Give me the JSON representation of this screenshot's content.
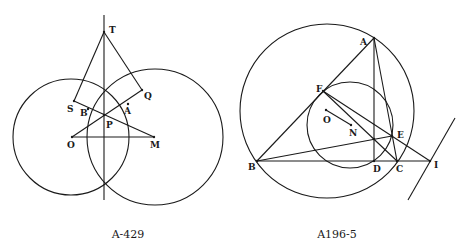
{
  "figures": [
    {
      "id": "left",
      "caption": "A-429",
      "caption_pos": [
        128,
        238
      ],
      "circles": [
        {
          "name": "circle-o",
          "cx": 71,
          "cy": 137,
          "r": 58
        },
        {
          "name": "circle-m",
          "cx": 155,
          "cy": 137,
          "r": 68
        }
      ],
      "points": {
        "T": [
          104,
          32
        ],
        "S": [
          74,
          101
        ],
        "Q": [
          142,
          90
        ],
        "B": [
          88,
          109
        ],
        "A": [
          128,
          104
        ],
        "P": [
          104,
          115
        ],
        "O": [
          72,
          137
        ],
        "M": [
          154,
          137
        ]
      },
      "labels": [
        {
          "text": "T",
          "x": 109,
          "y": 33
        },
        {
          "text": "S",
          "x": 67,
          "y": 112
        },
        {
          "text": "B",
          "x": 80,
          "y": 116
        },
        {
          "text": "A",
          "x": 124,
          "y": 114
        },
        {
          "text": "Q",
          "x": 144,
          "y": 99
        },
        {
          "text": "P",
          "x": 106,
          "y": 128
        },
        {
          "text": "O",
          "x": 67,
          "y": 148
        },
        {
          "text": "M",
          "x": 150,
          "y": 148
        }
      ],
      "segments": [
        {
          "name": "vertical-axis",
          "from": [
            104,
            15
          ],
          "to": [
            104,
            200
          ]
        },
        {
          "name": "segment-ts",
          "from": "T",
          "to": "S"
        },
        {
          "name": "segment-tq",
          "from": "T",
          "to": "Q"
        },
        {
          "name": "segment-sm",
          "from": "S",
          "to": "M"
        },
        {
          "name": "segment-oq",
          "from": "O",
          "to": "Q"
        },
        {
          "name": "segment-om",
          "from": "O",
          "to": "M"
        }
      ]
    },
    {
      "id": "right",
      "caption": "A196-5",
      "caption_pos": [
        337,
        238
      ],
      "circles": [
        {
          "name": "circumcircle",
          "cx": 327,
          "cy": 111,
          "r": 87
        },
        {
          "name": "nine-point-circle",
          "cx": 350,
          "cy": 125,
          "r": 43
        }
      ],
      "points": {
        "A": [
          374,
          38
        ],
        "B": [
          257,
          161
        ],
        "C": [
          397,
          161
        ],
        "D": [
          374,
          161
        ],
        "E": [
          392,
          136
        ],
        "F": [
          323,
          91
        ],
        "I": [
          430,
          161
        ],
        "O": [
          326,
          110
        ],
        "N": [
          351,
          125
        ],
        "H": [
          374,
          139
        ]
      },
      "labels": [
        {
          "text": "A",
          "x": 360,
          "y": 45
        },
        {
          "text": "F",
          "x": 316,
          "y": 92
        },
        {
          "text": "O",
          "x": 323,
          "y": 123
        },
        {
          "text": "N",
          "x": 349,
          "y": 136
        },
        {
          "text": "E",
          "x": 397,
          "y": 138
        },
        {
          "text": "B",
          "x": 248,
          "y": 170
        },
        {
          "text": "D",
          "x": 373,
          "y": 172
        },
        {
          "text": "C",
          "x": 396,
          "y": 172
        },
        {
          "text": "I",
          "x": 434,
          "y": 168
        }
      ],
      "segments": [
        {
          "name": "side-ab",
          "from": "A",
          "to": "B"
        },
        {
          "name": "side-ac",
          "from": "A",
          "to": "C"
        },
        {
          "name": "side-bc-extended",
          "from": "B",
          "to": "I"
        },
        {
          "name": "altitude-ad",
          "from": "A",
          "to": "D"
        },
        {
          "name": "altitude-be",
          "from": "B",
          "to": "E"
        },
        {
          "name": "altitude-cf",
          "from": "F",
          "to": "C"
        },
        {
          "name": "line-fi",
          "from": "F",
          "to": "I"
        },
        {
          "name": "segment-on",
          "from": "O",
          "to": "N"
        },
        {
          "name": "tangent-line",
          "from": [
            455,
            118
          ],
          "to": [
            408,
            200
          ]
        }
      ]
    }
  ]
}
